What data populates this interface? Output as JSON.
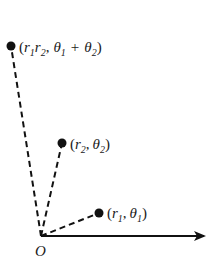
{
  "diagram": {
    "title": "",
    "origin": {
      "label": "O",
      "x": 41,
      "y": 236
    },
    "axis": {
      "x_end": 205,
      "y": 236,
      "color": "#111111"
    },
    "points": [
      {
        "id": "p1",
        "x": 99,
        "y": 213,
        "label_r": "r",
        "label_r_sub": "1",
        "label_theta": "θ",
        "label_theta_sub": "1"
      },
      {
        "id": "p2",
        "x": 62,
        "y": 143,
        "label_r": "r",
        "label_r_sub": "2",
        "label_theta": "θ",
        "label_theta_sub": "2"
      },
      {
        "id": "p3",
        "x": 11,
        "y": 46,
        "label_r1": "r",
        "label_r1_sub": "1",
        "label_r2": "r",
        "label_r2_sub": "2",
        "label_theta1": "θ",
        "label_theta1_sub": "1",
        "plus": "+",
        "label_theta2": "θ",
        "label_theta2_sub": "2"
      }
    ],
    "punct": {
      "open": "(",
      "comma": ",",
      "close": ")"
    },
    "colors": {
      "ink": "#111111"
    }
  }
}
